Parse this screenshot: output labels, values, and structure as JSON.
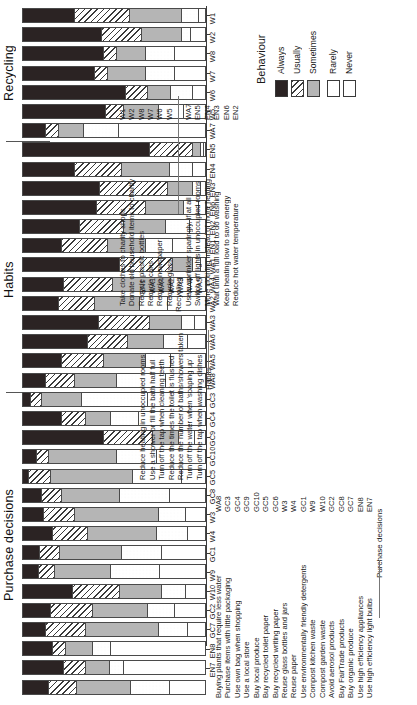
{
  "chart_data": {
    "type": "bar",
    "orientation": "horizontal-stacked-rotated",
    "title": "",
    "xlabel": "",
    "ylabel": "",
    "stacked": true,
    "normalized": true,
    "xlim": [
      0,
      100
    ],
    "grid": false,
    "legend_title": "Behaviour",
    "legend_position": "top-right",
    "series": [
      {
        "name": "Always",
        "key": "always",
        "fill": "solid-black"
      },
      {
        "name": "Usually",
        "key": "usually",
        "fill": "diagonal-hatch"
      },
      {
        "name": "Sometimes",
        "key": "sometimes",
        "fill": "solid-grey"
      },
      {
        "name": "Rarely",
        "key": "rarely",
        "fill": "dotted"
      },
      {
        "name": "Never",
        "key": "never",
        "fill": "white"
      }
    ],
    "groups": [
      {
        "name": "Recycling",
        "start": 0,
        "count": 7
      },
      {
        "name": "Habits",
        "start": 7,
        "count": 13
      },
      {
        "name": "Purchase decisions",
        "start": 20,
        "count": 13
      }
    ],
    "categories": [
      "W1",
      "W2",
      "W8",
      "W7",
      "W6",
      "W5",
      "WA7",
      "EN5",
      "EN4",
      "EN3",
      "EN6",
      "EN2",
      "EN1",
      "WA1",
      "WA4",
      "WA2",
      "WA3",
      "WA6",
      "WA5",
      "WA8",
      "GC3",
      "GC4",
      "GC9",
      "GC10",
      "GC5",
      "GC8",
      "W3",
      "W4",
      "GC1",
      "W9",
      "W10",
      "GC2",
      "GC8b",
      "GC7",
      "EN8",
      "EN7"
    ],
    "bars": [
      {
        "label": "W1",
        "values": [
          28,
          30,
          29,
          9,
          4
        ]
      },
      {
        "label": "W2",
        "values": [
          43,
          22,
          22,
          5,
          8
        ]
      },
      {
        "label": "W8",
        "values": [
          44,
          7,
          16,
          16,
          17
        ]
      },
      {
        "label": "W7",
        "values": [
          39,
          7,
          21,
          16,
          17
        ]
      },
      {
        "label": "W6",
        "values": [
          56,
          12,
          13,
          12,
          7
        ]
      },
      {
        "label": "W5",
        "values": [
          45,
          10,
          19,
          14,
          12
        ]
      },
      {
        "label": "WA7",
        "values": [
          12,
          7,
          14,
          19,
          48
        ]
      },
      {
        "label": "EN5",
        "values": [
          69,
          24,
          4,
          2,
          1
        ]
      },
      {
        "label": "EN4",
        "values": [
          28,
          26,
          26,
          13,
          7
        ]
      },
      {
        "label": "EN3",
        "values": [
          42,
          37,
          14,
          4,
          3
        ]
      },
      {
        "label": "EN6",
        "values": [
          40,
          27,
          21,
          8,
          4
        ]
      },
      {
        "label": "EN2",
        "values": [
          31,
          24,
          23,
          13,
          9
        ]
      },
      {
        "label": "EN1",
        "values": [
          21,
          25,
          21,
          15,
          18
        ]
      },
      {
        "label": "WA1",
        "values": [
          53,
          29,
          11,
          4,
          3
        ]
      },
      {
        "label": "WA4",
        "values": [
          22,
          27,
          32,
          11,
          8
        ]
      },
      {
        "label": "WA2",
        "values": [
          19,
          20,
          25,
          15,
          21
        ]
      },
      {
        "label": "WA3",
        "values": [
          41,
          28,
          18,
          7,
          6
        ]
      },
      {
        "label": "WA6",
        "values": [
          35,
          22,
          20,
          13,
          10
        ]
      },
      {
        "label": "WA5",
        "values": [
          21,
          23,
          23,
          14,
          19
        ]
      },
      {
        "label": "WA8",
        "values": [
          12,
          16,
          23,
          27,
          22
        ]
      },
      {
        "label": "GC3",
        "values": [
          4,
          6,
          22,
          36,
          32
        ]
      },
      {
        "label": "GC4",
        "values": [
          21,
          13,
          14,
          15,
          37
        ]
      },
      {
        "label": "GC9",
        "values": [
          44,
          27,
          14,
          9,
          6
        ]
      },
      {
        "label": "GC10",
        "values": [
          7,
          7,
          37,
          22,
          27
        ]
      },
      {
        "label": "GC5",
        "values": [
          3,
          12,
          45,
          27,
          13
        ]
      },
      {
        "label": "GC8",
        "values": [
          10,
          11,
          32,
          27,
          20
        ]
      },
      {
        "label": "W3",
        "values": [
          11,
          17,
          46,
          15,
          11
        ]
      },
      {
        "label": "W4",
        "values": [
          16,
          19,
          38,
          17,
          10
        ]
      },
      {
        "label": "GC1",
        "values": [
          9,
          11,
          34,
          22,
          24
        ]
      },
      {
        "label": "W9",
        "values": [
          8,
          9,
          31,
          27,
          25
        ]
      },
      {
        "label": "W10",
        "values": [
          27,
          26,
          23,
          13,
          11
        ]
      },
      {
        "label": "GC2",
        "values": [
          15,
          23,
          30,
          15,
          17
        ]
      },
      {
        "label": "GC7",
        "values": [
          12,
          22,
          40,
          16,
          10
        ]
      },
      {
        "label": "GC8b",
        "values": [
          16,
          7,
          15,
          10,
          52
        ]
      },
      {
        "label": "EN8",
        "values": [
          22,
          12,
          13,
          8,
          45
        ]
      },
      {
        "label": "EN7",
        "values": [
          14,
          15,
          30,
          21,
          20
        ]
      }
    ]
  },
  "chart": {
    "group_labels": {
      "recycling": "Recycling",
      "habits": "Habits",
      "purchase": "Purchase decisions"
    },
    "ytick_labels": [
      "W1",
      "W2",
      "W8",
      "W7",
      "W6",
      "W5",
      "WA7",
      "EN5",
      "EN4",
      "EN3",
      "EN6",
      "EN2",
      "EN1",
      "WA1",
      "WA4",
      "WA2",
      "WA3",
      "WA6",
      "WA5",
      "WA8",
      "GC3",
      "GC4",
      "GC9",
      "GC10",
      "GC5",
      "GC8",
      "W3",
      "W4",
      "GC1",
      "W9",
      "W10",
      "GC2",
      "GC7",
      "EN8",
      "EN7"
    ]
  },
  "legend": {
    "title": "Behaviour",
    "items": [
      {
        "label": "Always"
      },
      {
        "label": "Usually"
      },
      {
        "label": "Sometimes"
      },
      {
        "label": "Rarely"
      },
      {
        "label": "Never"
      }
    ]
  },
  "keys": {
    "habits_block": {
      "heading": "Habits",
      "rows": [
        {
          "code": "EN2",
          "text": "Reduce hot water temperature"
        },
        {
          "code": "EN6",
          "text": "Keep heating low to save energy"
        },
        {
          "code": "EN3",
          "text": "Wait until a full load to do washing"
        },
        {
          "code": "EN4",
          "text": "More clothing instead of more heating"
        },
        {
          "code": "EN5",
          "text": "Switch off lights in unoccupied rooms"
        },
        {
          "code": "WA7",
          "text": "Use a sprinkler sparingly, if at all"
        }
      ]
    },
    "recycling_block": {
      "heading": "Recycling",
      "rows": [
        {
          "code": "W5",
          "text": "Recycle glass"
        },
        {
          "code": "W6",
          "text": "Recycle newspaper"
        },
        {
          "code": "W7",
          "text": "Recycle cans"
        },
        {
          "code": "W8",
          "text": "Recycle plastic bottles"
        },
        {
          "code": "W2",
          "text": "Donate old household items to charity"
        },
        {
          "code": "W1",
          "text": "Take clothes to charity shops"
        }
      ]
    },
    "purchase_block": {
      "heading": "Purchase decisions",
      "rows": [
        {
          "code": "EN7",
          "text": "Use high efficiency light bulbs"
        },
        {
          "code": "EN8",
          "text": "Use high efficiency appliances"
        },
        {
          "code": "GC7",
          "text": "Buy organic produce"
        },
        {
          "code": "GC8",
          "text": "Buy FairTrade products"
        },
        {
          "code": "GC2",
          "text": "Avoid aerosol products"
        },
        {
          "code": "W10",
          "text": "Compost garden waste"
        },
        {
          "code": "W9",
          "text": "Compost kitchen waste"
        },
        {
          "code": "GC1",
          "text": "Use environmentally friendly detergents"
        },
        {
          "code": "W4",
          "text": "Reuse paper"
        },
        {
          "code": "W3",
          "text": "Reuse glass bottles and jars"
        },
        {
          "code": "GC6",
          "text": "Buy recycled writing paper"
        },
        {
          "code": "GC5",
          "text": "Buy recycled toilet paper"
        },
        {
          "code": "GC10",
          "text": "Buy local produce"
        },
        {
          "code": "GC9",
          "text": "Use a local store"
        },
        {
          "code": "GC4",
          "text": "Use own bag when shopping"
        },
        {
          "code": "GC3",
          "text": "Purchase items with little packaging"
        },
        {
          "code": "WA8",
          "text": "Buying plants that require less water"
        }
      ]
    },
    "habits2_block": {
      "heading": "Habits",
      "rows": [
        {
          "code": "WA5",
          "text": "Turn off the tap when washing dishes"
        },
        {
          "code": "WA6",
          "text": "Turn off the water when 'soaping up'"
        },
        {
          "code": "WA3",
          "text": "Reduce the number of baths/showers taken"
        },
        {
          "code": "WA2",
          "text": "Reduce the times the toilet is flushed"
        },
        {
          "code": "WA4",
          "text": "Turn off the tap when cleaning teeth"
        },
        {
          "code": "WA1",
          "text": "Use a shower or fill the bath half full"
        },
        {
          "code": "EN1",
          "text": "Reduce heating in unoccupied rooms"
        }
      ]
    }
  }
}
